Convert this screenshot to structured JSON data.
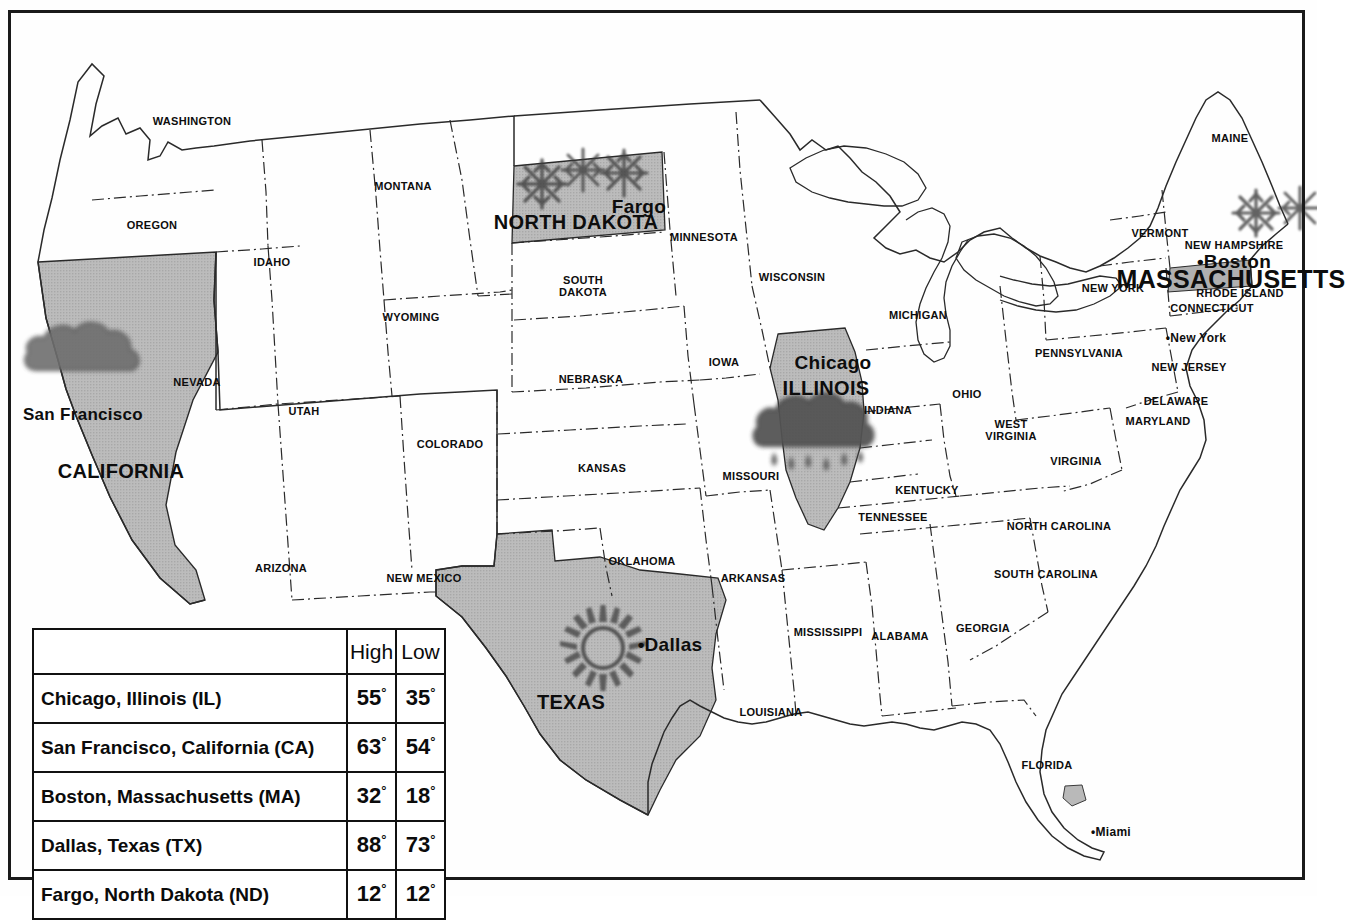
{
  "map": {
    "title": "United States weather map",
    "shaded_fill": "#b9b9b9",
    "outline_color": "#2a2a2a",
    "states": [
      {
        "name": "WASHINGTON",
        "x": 192,
        "y": 121,
        "size": "s"
      },
      {
        "name": "OREGON",
        "x": 152,
        "y": 225,
        "size": "s"
      },
      {
        "name": "IDAHO",
        "x": 272,
        "y": 262,
        "size": "s"
      },
      {
        "name": "MONTANA",
        "x": 403,
        "y": 186,
        "size": "s"
      },
      {
        "name": "WYOMING",
        "x": 411,
        "y": 317,
        "size": "s"
      },
      {
        "name": "NEVADA",
        "x": 197,
        "y": 382,
        "size": "s"
      },
      {
        "name": "UTAH",
        "x": 304,
        "y": 411,
        "size": "s"
      },
      {
        "name": "COLORADO",
        "x": 450,
        "y": 444,
        "size": "s"
      },
      {
        "name": "ARIZONA",
        "x": 281,
        "y": 568,
        "size": "s"
      },
      {
        "name": "NEW MEXICO",
        "x": 424,
        "y": 578,
        "size": "s"
      },
      {
        "name": "NORTH DAKOTA",
        "x": 576,
        "y": 222,
        "size": "big"
      },
      {
        "name": "SOUTH DAKOTA",
        "x": 583,
        "y": 286,
        "size": "s",
        "line2": true
      },
      {
        "name": "NEBRASKA",
        "x": 591,
        "y": 379,
        "size": "s"
      },
      {
        "name": "KANSAS",
        "x": 602,
        "y": 468,
        "size": "s"
      },
      {
        "name": "OKLAHOMA",
        "x": 642,
        "y": 561,
        "size": "s"
      },
      {
        "name": "TEXAS",
        "x": 571,
        "y": 702,
        "size": "big"
      },
      {
        "name": "MINNESOTA",
        "x": 704,
        "y": 237,
        "size": "s"
      },
      {
        "name": "IOWA",
        "x": 724,
        "y": 362,
        "size": "s"
      },
      {
        "name": "MISSOURI",
        "x": 751,
        "y": 476,
        "size": "s"
      },
      {
        "name": "ARKANSAS",
        "x": 753,
        "y": 578,
        "size": "s"
      },
      {
        "name": "LOUISIANA",
        "x": 771,
        "y": 712,
        "size": "s"
      },
      {
        "name": "WISCONSIN",
        "x": 792,
        "y": 277,
        "size": "s"
      },
      {
        "name": "ILLINOIS",
        "x": 826,
        "y": 388,
        "size": "big"
      },
      {
        "name": "MICHIGAN",
        "x": 918,
        "y": 315,
        "size": "s"
      },
      {
        "name": "INDIANA",
        "x": 888,
        "y": 410,
        "size": "s"
      },
      {
        "name": "OHIO",
        "x": 967,
        "y": 394,
        "size": "s"
      },
      {
        "name": "KENTUCKY",
        "x": 927,
        "y": 490,
        "size": "s"
      },
      {
        "name": "TENNESSEE",
        "x": 893,
        "y": 517,
        "size": "s"
      },
      {
        "name": "MISSISSIPPI",
        "x": 828,
        "y": 632,
        "size": "s"
      },
      {
        "name": "ALABAMA",
        "x": 900,
        "y": 636,
        "size": "s"
      },
      {
        "name": "GEORGIA",
        "x": 983,
        "y": 628,
        "size": "s"
      },
      {
        "name": "FLORIDA",
        "x": 1047,
        "y": 765,
        "size": "s"
      },
      {
        "name": "SOUTH CAROLINA",
        "x": 1046,
        "y": 574,
        "size": "s"
      },
      {
        "name": "NORTH CAROLINA",
        "x": 1059,
        "y": 526,
        "size": "s"
      },
      {
        "name": "VIRGINIA",
        "x": 1076,
        "y": 461,
        "size": "s"
      },
      {
        "name": "WEST VIRGINIA",
        "x": 1011,
        "y": 430,
        "size": "s",
        "line2": true
      },
      {
        "name": "MARYLAND",
        "x": 1158,
        "y": 421,
        "size": "s"
      },
      {
        "name": "DELAWARE",
        "x": 1176,
        "y": 401,
        "size": "s"
      },
      {
        "name": "NEW JERSEY",
        "x": 1189,
        "y": 367,
        "size": "s"
      },
      {
        "name": "PENNSYLVANIA",
        "x": 1079,
        "y": 353,
        "size": "s"
      },
      {
        "name": "NEW YORK",
        "x": 1113,
        "y": 288,
        "size": "s"
      },
      {
        "name": "CONNECTICUT",
        "x": 1212,
        "y": 308,
        "size": "s"
      },
      {
        "name": "RHODE ISLAND",
        "x": 1240,
        "y": 293,
        "size": "s"
      },
      {
        "name": "MASSACHUSETTS",
        "x": 1231,
        "y": 279,
        "size": "xbig"
      },
      {
        "name": "NEW HAMPSHIRE",
        "x": 1234,
        "y": 245,
        "size": "s"
      },
      {
        "name": "VERMONT",
        "x": 1160,
        "y": 233,
        "size": "s"
      },
      {
        "name": "MAINE",
        "x": 1230,
        "y": 138,
        "size": "s"
      },
      {
        "name": "CALIFORNIA",
        "x": 121,
        "y": 471,
        "size": "big"
      }
    ],
    "cities": [
      {
        "name": "Fargo",
        "x": 639,
        "y": 207,
        "size": "city",
        "dot": false
      },
      {
        "name": "Chicago",
        "x": 833,
        "y": 363,
        "size": "city",
        "dot": false
      },
      {
        "name": "Dallas",
        "x": 670,
        "y": 645,
        "size": "city",
        "dot": true
      },
      {
        "name": "San Francisco",
        "x": 83,
        "y": 415,
        "size": "city2",
        "dot": false
      },
      {
        "name": "Boston",
        "x": 1234,
        "y": 262,
        "size": "city",
        "dot": true
      },
      {
        "name": "New York",
        "x": 1196,
        "y": 339,
        "size": "city3",
        "dot": true
      },
      {
        "name": "Miami",
        "x": 1111,
        "y": 833,
        "size": "city3",
        "dot": true
      }
    ],
    "weather_icons": [
      {
        "type": "snowflake-icon",
        "x": 542,
        "y": 184,
        "size": 52,
        "state": "north-dakota"
      },
      {
        "type": "snowflake-icon",
        "x": 583,
        "y": 170,
        "size": 46,
        "state": "north-dakota"
      },
      {
        "type": "snowflake-icon",
        "x": 624,
        "y": 173,
        "size": 50,
        "state": "north-dakota"
      },
      {
        "type": "cloud-icon",
        "x": 88,
        "y": 356,
        "size": 110,
        "state": "california"
      },
      {
        "type": "rain-cloud-icon",
        "x": 818,
        "y": 430,
        "size": 115,
        "state": "illinois"
      },
      {
        "type": "sun-icon",
        "x": 603,
        "y": 648,
        "size": 86,
        "state": "texas"
      },
      {
        "type": "snowflake-icon",
        "x": 1256,
        "y": 213,
        "size": 50,
        "state": "massachusetts"
      },
      {
        "type": "snowflake-icon",
        "x": 1300,
        "y": 208,
        "size": 46,
        "state": "massachusetts"
      }
    ]
  },
  "legend_table": {
    "name": "temperature-legend-table",
    "columns": [
      "",
      "High",
      "Low"
    ],
    "rows": [
      {
        "city": "Chicago, Illinois (IL)",
        "high": "55",
        "low": "35"
      },
      {
        "city": "San Francisco, California (CA)",
        "high": "63",
        "low": "54"
      },
      {
        "city": "Boston, Massachusetts (MA)",
        "high": "32",
        "low": "18"
      },
      {
        "city": "Dallas, Texas (TX)",
        "high": "88",
        "low": "73"
      },
      {
        "city": "Fargo, North Dakota (ND)",
        "high": "12",
        "low": "12"
      }
    ],
    "degree_symbol": "°"
  }
}
